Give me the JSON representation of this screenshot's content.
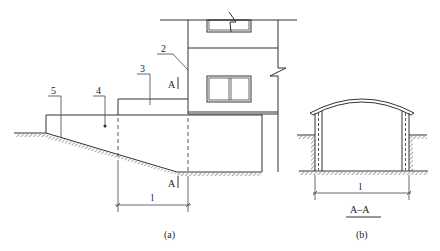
{
  "figure_a": {
    "caption": "(a)",
    "leaders": [
      {
        "id": "2",
        "label": "2"
      },
      {
        "id": "3",
        "label": "3"
      },
      {
        "id": "4",
        "label": "4"
      },
      {
        "id": "5",
        "label": "5"
      }
    ],
    "section_mark_top": "A",
    "section_mark_bottom": "A",
    "dimension_label": "l"
  },
  "figure_b": {
    "caption": "(b)",
    "section_title": "A–A",
    "dimension_label": "l"
  },
  "colors": {
    "line": "#333333",
    "hatch": "#555555",
    "background": "#ffffff"
  }
}
